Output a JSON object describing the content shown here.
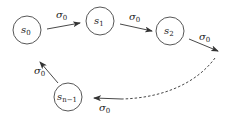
{
  "diagram": {
    "type": "state-transition-cycle",
    "nodes": [
      {
        "id": "s0",
        "base": "s",
        "sub": "0",
        "cx": 27,
        "cy": 30,
        "r": 14
      },
      {
        "id": "s1",
        "base": "s",
        "sub": "1",
        "cx": 100,
        "cy": 21,
        "r": 14
      },
      {
        "id": "s2",
        "base": "s",
        "sub": "2",
        "cx": 170,
        "cy": 31,
        "r": 14
      },
      {
        "id": "sn1",
        "base": "s",
        "sub": "n−1",
        "cx": 68,
        "cy": 97,
        "r": 14
      }
    ],
    "edges": [
      {
        "from": "s0",
        "to": "s1",
        "label_base": "σ",
        "label_sub": "0",
        "style": "solid"
      },
      {
        "from": "s1",
        "to": "s2",
        "label_base": "σ",
        "label_sub": "0",
        "style": "solid"
      },
      {
        "from": "s2",
        "to": "…",
        "label_base": "σ",
        "label_sub": "0",
        "style": "solid"
      },
      {
        "from": "…",
        "to": "sn1",
        "label_base": "σ",
        "label_sub": "0",
        "style": "dashed"
      },
      {
        "from": "sn1",
        "to": "s0",
        "label_base": "σ",
        "label_sub": "0",
        "style": "solid"
      }
    ]
  }
}
